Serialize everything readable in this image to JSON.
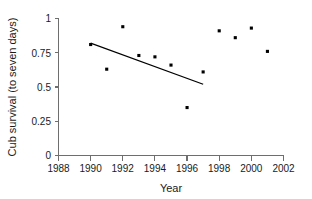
{
  "chart_data": {
    "type": "scatter",
    "title": "",
    "xlabel": "Year",
    "ylabel": "Cub survival (to seven days)",
    "x": [
      1990,
      1991,
      1992,
      1993,
      1994,
      1995,
      1996,
      1997,
      1998,
      1999,
      2000,
      2001
    ],
    "values": [
      0.81,
      0.63,
      0.94,
      0.73,
      0.72,
      0.66,
      0.35,
      0.61,
      0.91,
      0.86,
      0.93,
      0.76
    ],
    "series": [
      {
        "name": "Cub survival",
        "points": [
          {
            "x": 1990,
            "y": 0.81
          },
          {
            "x": 1991,
            "y": 0.63
          },
          {
            "x": 1992,
            "y": 0.94
          },
          {
            "x": 1993,
            "y": 0.73
          },
          {
            "x": 1994,
            "y": 0.72
          },
          {
            "x": 1995,
            "y": 0.66
          },
          {
            "x": 1996,
            "y": 0.35
          },
          {
            "x": 1997,
            "y": 0.61
          },
          {
            "x": 1998,
            "y": 0.91
          },
          {
            "x": 1999,
            "y": 0.86
          },
          {
            "x": 2000,
            "y": 0.93
          },
          {
            "x": 2001,
            "y": 0.76
          }
        ]
      }
    ],
    "trend_line": {
      "name": "regression-line",
      "x_start": 1990.0,
      "y_start": 0.82,
      "x_end": 1997.0,
      "y_end": 0.52
    },
    "xlim": [
      1988,
      2002
    ],
    "ylim": [
      0,
      1
    ],
    "xticks": [
      1988,
      1990,
      1992,
      1994,
      1996,
      1998,
      2000,
      2002
    ],
    "xtick_labels": [
      "1988",
      "1990",
      "1992",
      "1994",
      "1996",
      "1998",
      "2000",
      "2002"
    ],
    "yticks": [
      0,
      0.25,
      0.5,
      0.75,
      1
    ],
    "ytick_labels": [
      "0",
      "0.25",
      "0.5",
      "0.75",
      "1"
    ],
    "grid": false,
    "legend": null,
    "legend_position": "none",
    "marker": "square",
    "marker_color": "#000000",
    "axis_color": "#6e6e6e",
    "background_color": "#ffffff"
  },
  "axes": {
    "x_title": "Year",
    "y_title": "Cub survival (to seven days)"
  }
}
